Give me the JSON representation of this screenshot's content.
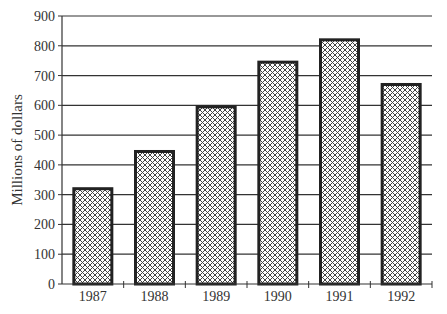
{
  "chart_data": {
    "type": "bar",
    "title": "",
    "xlabel": "",
    "ylabel": "Millions of dollars",
    "categories": [
      "1987",
      "1988",
      "1989",
      "1990",
      "1991",
      "1992"
    ],
    "values": [
      320,
      445,
      595,
      745,
      820,
      670
    ],
    "ylim": [
      0,
      900
    ],
    "yticks": [
      0,
      100,
      200,
      300,
      400,
      500,
      600,
      700,
      800,
      900
    ],
    "grid": true,
    "legend": null,
    "bar_fill": "crosshatch",
    "colors": {
      "bar_border": "#222222",
      "grid": "#333333",
      "hatch": "#444444"
    }
  }
}
